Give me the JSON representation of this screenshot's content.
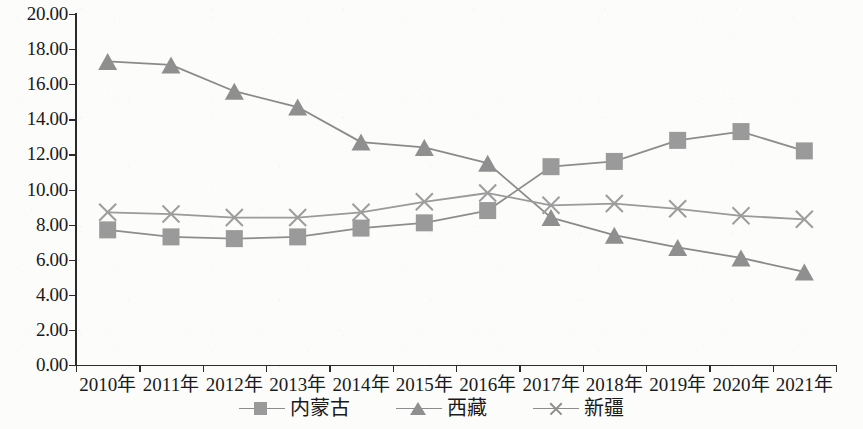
{
  "chart_data": {
    "type": "line",
    "title": "",
    "subtitle": "",
    "xlabel": "",
    "ylabel": "",
    "categories": [
      "2010年",
      "2011年",
      "2012年",
      "2013年",
      "2014年",
      "2015年",
      "2016年",
      "2017年",
      "2018年",
      "2019年",
      "2020年",
      "2021年"
    ],
    "ylim": [
      0.0,
      20.0
    ],
    "ytick_labels": [
      "20.00",
      "18.00",
      "16.00",
      "14.00",
      "12.00",
      "10.00",
      "8.00",
      "6.00",
      "4.00",
      "2.00",
      "0.00"
    ],
    "ytick_values": [
      20.0,
      18.0,
      16.0,
      14.0,
      12.0,
      10.0,
      8.0,
      6.0,
      4.0,
      2.0,
      0.0
    ],
    "grid": false,
    "legend_position": "bottom",
    "series": [
      {
        "name": "内蒙古",
        "marker": "square",
        "color": "#9a9a9a",
        "line_color": "#8d8d8d",
        "values": [
          7.7,
          7.3,
          7.2,
          7.3,
          7.8,
          8.1,
          8.8,
          11.3,
          11.6,
          12.8,
          13.3,
          12.2
        ]
      },
      {
        "name": "西藏",
        "marker": "triangle",
        "color": "#8f8f8f",
        "line_color": "#8a8a8a",
        "values": [
          17.3,
          17.1,
          15.6,
          14.7,
          12.7,
          12.4,
          11.5,
          8.4,
          7.4,
          6.7,
          6.1,
          5.3
        ]
      },
      {
        "name": "新疆",
        "marker": "cross",
        "color": "#9d9d9d",
        "line_color": "#9a9a9a",
        "values": [
          8.7,
          8.6,
          8.4,
          8.4,
          8.7,
          9.3,
          9.8,
          9.1,
          9.2,
          8.9,
          8.5,
          8.3
        ]
      }
    ]
  },
  "legend": {
    "items": [
      {
        "label": "内蒙古",
        "marker": "square-marker-icon"
      },
      {
        "label": "西藏",
        "marker": "triangle-marker-icon"
      },
      {
        "label": "新疆",
        "marker": "cross-marker-icon"
      }
    ]
  },
  "colors": {
    "axis": "#2b2b2b",
    "background": "#fcfcfb",
    "series_gray": "#8d8d8d"
  }
}
